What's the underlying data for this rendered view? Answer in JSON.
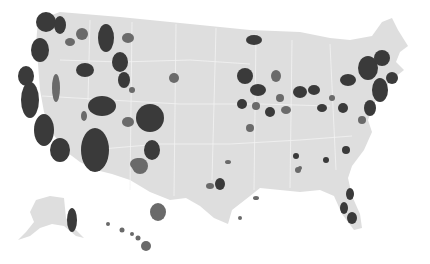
{
  "map": {
    "type": "choropleth",
    "region": "United States (counties)",
    "colors": {
      "background": "#ffffff",
      "land": "#dedede",
      "border": "#f2f2f2",
      "dark": "#3a3a3a",
      "mid": "#6a6a6a",
      "light": "#9a9a9a"
    },
    "conus_path": "M38,20 L60,12 L120,17 L190,24 L250,30 L300,32 L330,38 L350,40 L372,36 L382,22 L392,18 L398,30 L408,46 L400,52 L396,62 L404,70 L394,78 L382,90 L374,104 L368,120 L372,132 L364,150 L352,166 L348,178 L352,196 L360,214 L362,228 L354,230 L342,214 L334,196 L320,190 L300,192 L280,190 L260,188 L250,196 L232,210 L228,224 L214,218 L200,206 L186,198 L170,200 L150,192 L130,180 L112,174 L96,170 L80,162 L64,150 L52,132 L44,112 L40,90 L38,64 L36,44 Z",
    "alaska_path": "M36,200 L50,196 L64,198 L66,218 L72,226 L84,238 L76,236 L64,226 L52,224 L40,228 L30,236 L18,240 L26,232 L34,222 L30,212 Z",
    "hawaii": [
      [
        108,
        224,
        2
      ],
      [
        122,
        230,
        2.5
      ],
      [
        132,
        234,
        2
      ],
      [
        138,
        238,
        2.5
      ],
      [
        146,
        246,
        5
      ]
    ],
    "borders": [
      "M60,60 L120,62 L190,60 L250,64",
      "M42,96 L110,100 L180,104 L260,104 L330,106",
      "M90,150 L160,144 L230,144 L300,140 L352,136",
      "M90,20 L88,100",
      "M132,22 L130,190",
      "M176,24 L174,196",
      "M216,28 L212,180",
      "M256,34 L254,190",
      "M292,40 L290,188",
      "M330,44 L336,170"
    ],
    "blobs": [
      {
        "x": 46,
        "y": 22,
        "rx": 10,
        "ry": 10,
        "shade": "dark"
      },
      {
        "x": 60,
        "y": 25,
        "rx": 6,
        "ry": 9,
        "shade": "dark"
      },
      {
        "x": 40,
        "y": 50,
        "rx": 9,
        "ry": 12,
        "shade": "dark"
      },
      {
        "x": 26,
        "y": 76,
        "rx": 8,
        "ry": 10,
        "shade": "dark"
      },
      {
        "x": 30,
        "y": 100,
        "rx": 9,
        "ry": 18,
        "shade": "dark"
      },
      {
        "x": 44,
        "y": 130,
        "rx": 10,
        "ry": 16,
        "shade": "dark"
      },
      {
        "x": 60,
        "y": 150,
        "rx": 10,
        "ry": 12,
        "shade": "dark"
      },
      {
        "x": 56,
        "y": 88,
        "rx": 4,
        "ry": 14,
        "shade": "mid"
      },
      {
        "x": 82,
        "y": 34,
        "rx": 6,
        "ry": 6,
        "shade": "mid"
      },
      {
        "x": 70,
        "y": 42,
        "rx": 5,
        "ry": 4,
        "shade": "mid"
      },
      {
        "x": 85,
        "y": 70,
        "rx": 9,
        "ry": 7,
        "shade": "dark"
      },
      {
        "x": 106,
        "y": 38,
        "rx": 8,
        "ry": 14,
        "shade": "dark"
      },
      {
        "x": 120,
        "y": 62,
        "rx": 8,
        "ry": 10,
        "shade": "dark"
      },
      {
        "x": 124,
        "y": 80,
        "rx": 6,
        "ry": 8,
        "shade": "dark"
      },
      {
        "x": 128,
        "y": 38,
        "rx": 6,
        "ry": 5,
        "shade": "mid"
      },
      {
        "x": 132,
        "y": 90,
        "rx": 3,
        "ry": 3,
        "shade": "mid"
      },
      {
        "x": 102,
        "y": 106,
        "rx": 14,
        "ry": 10,
        "shade": "dark"
      },
      {
        "x": 84,
        "y": 116,
        "rx": 3,
        "ry": 5,
        "shade": "mid"
      },
      {
        "x": 150,
        "y": 118,
        "rx": 14,
        "ry": 14,
        "shade": "dark"
      },
      {
        "x": 128,
        "y": 122,
        "rx": 6,
        "ry": 5,
        "shade": "mid"
      },
      {
        "x": 95,
        "y": 150,
        "rx": 14,
        "ry": 22,
        "shade": "dark"
      },
      {
        "x": 140,
        "y": 166,
        "rx": 8,
        "ry": 8,
        "shade": "mid"
      },
      {
        "x": 152,
        "y": 150,
        "rx": 8,
        "ry": 10,
        "shade": "dark"
      },
      {
        "x": 174,
        "y": 78,
        "rx": 5,
        "ry": 5,
        "shade": "mid"
      },
      {
        "x": 138,
        "y": 164,
        "rx": 8,
        "ry": 6,
        "shade": "mid"
      },
      {
        "x": 158,
        "y": 212,
        "rx": 8,
        "ry": 9,
        "shade": "mid"
      },
      {
        "x": 220,
        "y": 184,
        "rx": 5,
        "ry": 6,
        "shade": "dark"
      },
      {
        "x": 210,
        "y": 186,
        "rx": 4,
        "ry": 3,
        "shade": "mid"
      },
      {
        "x": 254,
        "y": 40,
        "rx": 8,
        "ry": 5,
        "shade": "dark"
      },
      {
        "x": 245,
        "y": 76,
        "rx": 8,
        "ry": 8,
        "shade": "dark"
      },
      {
        "x": 258,
        "y": 90,
        "rx": 8,
        "ry": 6,
        "shade": "dark"
      },
      {
        "x": 276,
        "y": 76,
        "rx": 5,
        "ry": 6,
        "shade": "mid"
      },
      {
        "x": 280,
        "y": 98,
        "rx": 4,
        "ry": 4,
        "shade": "mid"
      },
      {
        "x": 300,
        "y": 92,
        "rx": 7,
        "ry": 6,
        "shade": "dark"
      },
      {
        "x": 314,
        "y": 90,
        "rx": 6,
        "ry": 5,
        "shade": "dark"
      },
      {
        "x": 242,
        "y": 104,
        "rx": 5,
        "ry": 5,
        "shade": "dark"
      },
      {
        "x": 256,
        "y": 106,
        "rx": 4,
        "ry": 4,
        "shade": "mid"
      },
      {
        "x": 270,
        "y": 112,
        "rx": 5,
        "ry": 5,
        "shade": "dark"
      },
      {
        "x": 286,
        "y": 110,
        "rx": 5,
        "ry": 4,
        "shade": "mid"
      },
      {
        "x": 250,
        "y": 128,
        "rx": 4,
        "ry": 4,
        "shade": "mid"
      },
      {
        "x": 322,
        "y": 108,
        "rx": 5,
        "ry": 4,
        "shade": "dark"
      },
      {
        "x": 348,
        "y": 80,
        "rx": 8,
        "ry": 6,
        "shade": "dark"
      },
      {
        "x": 368,
        "y": 68,
        "rx": 10,
        "ry": 12,
        "shade": "dark"
      },
      {
        "x": 382,
        "y": 58,
        "rx": 8,
        "ry": 8,
        "shade": "dark"
      },
      {
        "x": 392,
        "y": 78,
        "rx": 6,
        "ry": 6,
        "shade": "dark"
      },
      {
        "x": 380,
        "y": 90,
        "rx": 8,
        "ry": 12,
        "shade": "dark"
      },
      {
        "x": 370,
        "y": 108,
        "rx": 6,
        "ry": 8,
        "shade": "dark"
      },
      {
        "x": 362,
        "y": 120,
        "rx": 4,
        "ry": 4,
        "shade": "mid"
      },
      {
        "x": 343,
        "y": 108,
        "rx": 5,
        "ry": 5,
        "shade": "dark"
      },
      {
        "x": 332,
        "y": 98,
        "rx": 3,
        "ry": 3,
        "shade": "mid"
      },
      {
        "x": 296,
        "y": 156,
        "rx": 3,
        "ry": 3,
        "shade": "dark"
      },
      {
        "x": 298,
        "y": 170,
        "rx": 3,
        "ry": 3,
        "shade": "mid"
      },
      {
        "x": 326,
        "y": 160,
        "rx": 3,
        "ry": 3,
        "shade": "dark"
      },
      {
        "x": 346,
        "y": 150,
        "rx": 4,
        "ry": 4,
        "shade": "dark"
      },
      {
        "x": 300,
        "y": 168,
        "rx": 2,
        "ry": 2,
        "shade": "mid"
      },
      {
        "x": 352,
        "y": 218,
        "rx": 5,
        "ry": 6,
        "shade": "dark"
      },
      {
        "x": 344,
        "y": 208,
        "rx": 4,
        "ry": 6,
        "shade": "dark"
      },
      {
        "x": 350,
        "y": 194,
        "rx": 4,
        "ry": 6,
        "shade": "dark"
      },
      {
        "x": 256,
        "y": 198,
        "rx": 3,
        "ry": 2,
        "shade": "mid"
      },
      {
        "x": 228,
        "y": 162,
        "rx": 3,
        "ry": 2,
        "shade": "mid"
      },
      {
        "x": 240,
        "y": 218,
        "rx": 2,
        "ry": 2,
        "shade": "mid"
      },
      {
        "x": 72,
        "y": 220,
        "rx": 5,
        "ry": 12,
        "shade": "dark"
      }
    ]
  }
}
